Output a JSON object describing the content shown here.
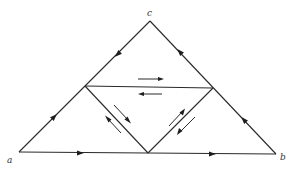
{
  "diagram": {
    "type": "triangle-subdivision-orientation",
    "vertices": {
      "a": {
        "label": "a",
        "x": 19,
        "y": 152
      },
      "b": {
        "label": "b",
        "x": 276,
        "y": 154
      },
      "c": {
        "label": "c",
        "x": 150,
        "y": 21
      }
    },
    "midpoints": {
      "ac": {
        "x": 85,
        "y": 86
      },
      "bc": {
        "x": 213,
        "y": 88
      },
      "ab": {
        "x": 148,
        "y": 153
      }
    },
    "outer_edge_arrows": [
      {
        "edge": "a-mid_ab",
        "direction": "right"
      },
      {
        "edge": "mid_ab-b",
        "direction": "right"
      },
      {
        "edge": "b-mid_bc",
        "direction": "toward c"
      },
      {
        "edge": "mid_bc-c",
        "direction": "toward c"
      },
      {
        "edge": "c-mid_ac",
        "direction": "toward a"
      },
      {
        "edge": "mid_ac-a",
        "direction": "toward c"
      }
    ],
    "inner_edge_arrows": [
      {
        "edge": "mid_ac-mid_bc",
        "pair": [
          "right",
          "left"
        ]
      },
      {
        "edge": "mid_ac-mid_ab",
        "pair": [
          "down-right",
          "up-left"
        ]
      },
      {
        "edge": "mid_bc-mid_ab",
        "pair": [
          "up-right",
          "down-left"
        ]
      }
    ],
    "line_color": "#2a2a2a",
    "background": "#ffffff"
  }
}
